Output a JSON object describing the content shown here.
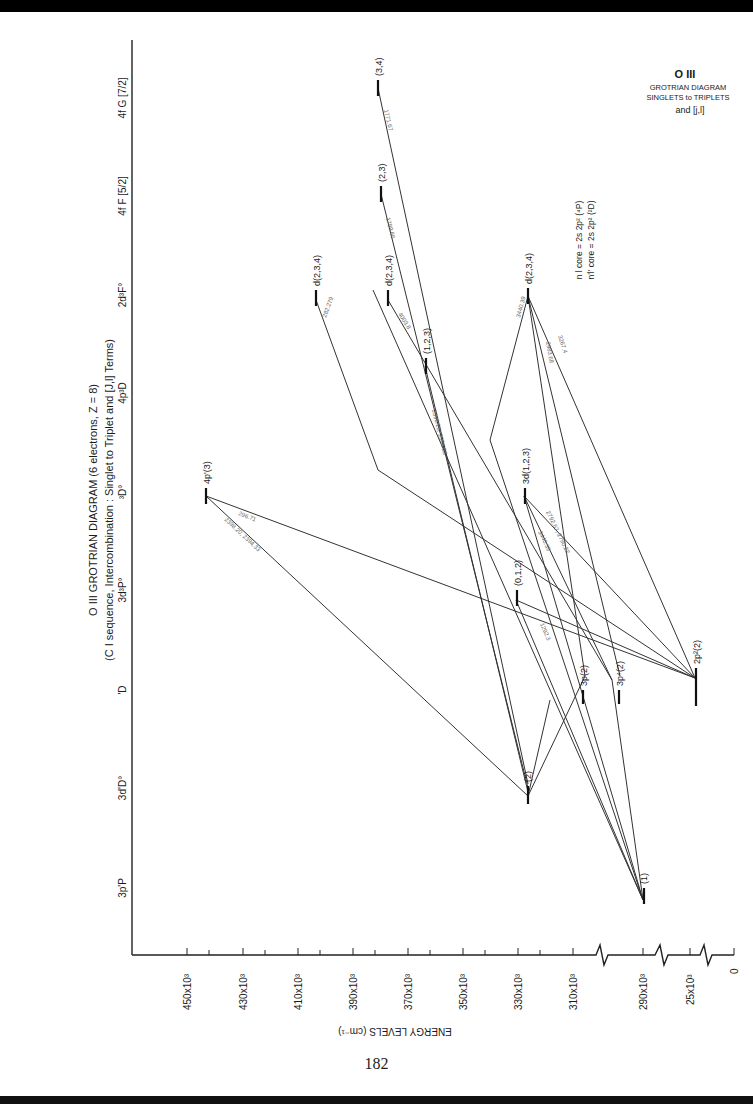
{
  "title": {
    "main": "O III  GROTRIAN DIAGRAM (6 electrons, Z = 8)",
    "sub": "(C I sequence, Intercombination : Singlet to Triplet and [J,l] Terms)"
  },
  "legend_box": {
    "ion": "O III",
    "line1": "GROTRIAN DIAGRAM",
    "line2": "SINGLETS to TRIPLETS",
    "line3": "and [j,l]"
  },
  "core_notes": {
    "nl": "n l  core =  2s 2p² (⁴P)",
    "nl_prime": "n'l' core =  2s 2p² (²D)"
  },
  "columns": [
    "3p'P",
    "3d'D°",
    "'D",
    "3d³P°",
    "³D°",
    "4p³D",
    "2d³F°",
    "4f F [5/2]",
    "4f G [7/2]"
  ],
  "energy_axis": {
    "title": "ENERGY LEVELS (cm⁻¹)",
    "ticks": [
      "450x10³",
      "430x10³",
      "410x10³",
      "390x10³",
      "370x10³",
      "350x10³",
      "330x10³",
      "310x10³",
      "290x10³",
      "25x10³",
      "0"
    ]
  },
  "levels": {
    "p1": "(1)",
    "d2": "(2)",
    "p3a": "3p(2)",
    "p3b": "3p⁴(2)",
    "gs": "2p²(2)",
    "l012": "(0,1,2)",
    "d3d": "3d(1,2,3)",
    "l123": "(1,2,3)",
    "p4": "4p'(3)",
    "d234a": "d(2,3,4)",
    "d234b": "d(2,3,4)",
    "d234c": "d(2,3,4)",
    "l23": "(2,3)",
    "l34": "(3,4)"
  },
  "wavelengths": {
    "w1": "296.71",
    "w2": "2398.20, 2394.33",
    "w3": "2398.20, 2394.33",
    "w4": "2792.67, 2790.22",
    "w5": "3440.39",
    "w6": "1292.3",
    "w7": "3440.39",
    "w8": "2983.68",
    "w9": "3267.4",
    "w10": "4003.8",
    "w11": "1789.66",
    "w12": "1771.67",
    "w13": "282.279"
  },
  "page_number": "182"
}
